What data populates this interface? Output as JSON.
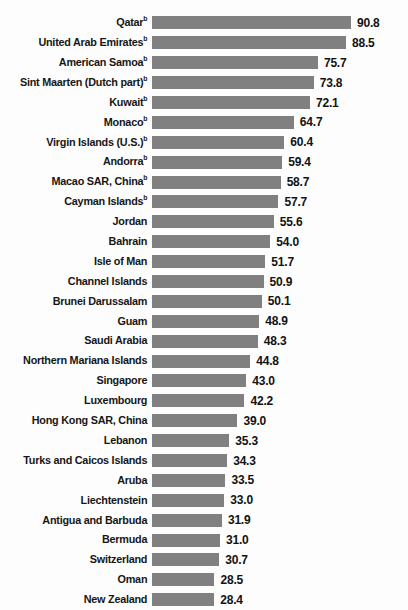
{
  "chart_data": {
    "type": "bar",
    "title": "",
    "subtitle": "",
    "xlabel": "",
    "ylabel": "",
    "orientation": "horizontal",
    "grid": false,
    "legend": null,
    "axis_visible": false,
    "xlim": [
      0,
      90.8
    ],
    "bar_color": "#808080",
    "value_label_format": "one-decimal",
    "sort": "descending",
    "footnote_marker": "b",
    "categories": [
      "Qatar",
      "United Arab Emirates",
      "American Samoa",
      "Sint Maarten (Dutch part)",
      "Kuwait",
      "Monaco",
      "Virgin Islands (U.S.)",
      "Andorra",
      "Macao SAR, China",
      "Cayman Islands",
      "Jordan",
      "Bahrain",
      "Isle of Man",
      "Channel Islands",
      "Brunei Darussalam",
      "Guam",
      "Saudi Arabia",
      "Northern Mariana Islands",
      "Singapore",
      "Luxembourg",
      "Hong Kong SAR, China",
      "Lebanon",
      "Turks and Caicos Islands",
      "Aruba",
      "Liechtenstein",
      "Antigua and Barbuda",
      "Bermuda",
      "Switzerland",
      "Oman",
      "New Zealand"
    ],
    "values": [
      90.8,
      88.5,
      75.7,
      73.8,
      72.1,
      64.7,
      60.4,
      59.4,
      58.7,
      57.7,
      55.6,
      54.0,
      51.7,
      50.9,
      50.1,
      48.9,
      48.3,
      44.8,
      43.0,
      42.2,
      39.0,
      35.3,
      34.3,
      33.5,
      33.0,
      31.9,
      31.0,
      30.7,
      28.5,
      28.4
    ],
    "marked": [
      true,
      true,
      true,
      true,
      true,
      true,
      true,
      true,
      true,
      true,
      false,
      false,
      false,
      false,
      false,
      false,
      false,
      false,
      false,
      false,
      false,
      false,
      false,
      false,
      false,
      false,
      false,
      false,
      false,
      false
    ],
    "value_labels": [
      "90.8",
      "88.5",
      "75.7",
      "73.8",
      "72.1",
      "64.7",
      "60.4",
      "59.4",
      "58.7",
      "57.7",
      "55.6",
      "54.0",
      "51.7",
      "50.9",
      "50.1",
      "48.9",
      "48.3",
      "44.8",
      "43.0",
      "42.2",
      "39.0",
      "35.3",
      "34.3",
      "33.5",
      "33.0",
      "31.9",
      "31.0",
      "30.7",
      "28.5",
      "28.4"
    ]
  }
}
